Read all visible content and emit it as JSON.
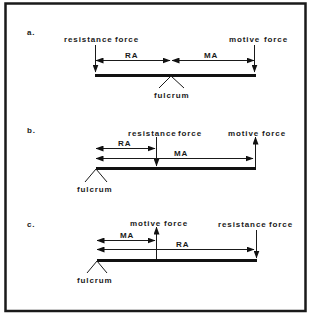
{
  "figure": {
    "panels": [
      {
        "id": "a",
        "label": "a.",
        "resistance_label": "resistance",
        "resistance_force_label": "force",
        "motive_label": "motive",
        "motive_force_label": "force",
        "ra_label": "RA",
        "ma_label": "MA",
        "fulcrum_label": "fulcrum",
        "arrangement": "fulcrum between resistance force (left) and motive force (right)"
      },
      {
        "id": "b",
        "label": "b.",
        "resistance_label": "resistance",
        "resistance_force_label": "force",
        "motive_label": "motive",
        "motive_force_label": "force",
        "ra_label": "RA",
        "ma_label": "MA",
        "fulcrum_label": "fulcrum",
        "arrangement": "fulcrum at left end, resistance force in middle (down), motive force at right end (up)"
      },
      {
        "id": "c",
        "label": "c.",
        "resistance_label": "resistance",
        "resistance_force_label": "force",
        "motive_label": "motive",
        "motive_force_label": "force",
        "ra_label": "RA",
        "ma_label": "MA",
        "fulcrum_label": "fulcrum",
        "arrangement": "fulcrum at left end, motive force in middle (up), resistance force at right end (down)"
      }
    ],
    "colors": {
      "ink": "#111111",
      "background": "#ffffff"
    }
  }
}
